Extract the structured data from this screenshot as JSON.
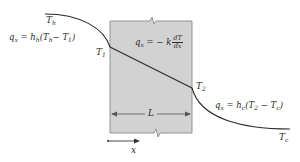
{
  "diagram": {
    "colors": {
      "wall_fill": "#d2d2d2",
      "wall_border": "#8a8a8a",
      "line": "#2a2a2a",
      "text": "#2a2a2a"
    },
    "labels": {
      "T_h": {
        "base": "T",
        "sub": "h"
      },
      "T_1": {
        "base": "T",
        "sub": "1"
      },
      "T_2": {
        "base": "T",
        "sub": "2"
      },
      "T_c": {
        "base": "T",
        "sub": "c"
      },
      "L": "L",
      "x": "x"
    },
    "equations": {
      "hot_side": {
        "lhs": "q",
        "lhs_sub": "x",
        "rhs_pre": " = h",
        "rhs_h_sub": "h",
        "rhs_paren_open": "(T",
        "rhs_t1_sub": "h",
        "rhs_minus": "− T",
        "rhs_t2_sub": "1",
        "rhs_close": ")"
      },
      "conduction": {
        "lhs": "q",
        "lhs_sub": "x",
        "rhs_pre": " = − k",
        "frac_num": "dT",
        "frac_den": "dx"
      },
      "cold_side": {
        "lhs": "q",
        "lhs_sub": "x",
        "rhs_pre": " = h",
        "rhs_h_sub": "c",
        "rhs_paren_open": "(T",
        "rhs_t1_sub": "2",
        "rhs_minus": " − T",
        "rhs_t2_sub": "c",
        "rhs_close": ")"
      }
    }
  }
}
